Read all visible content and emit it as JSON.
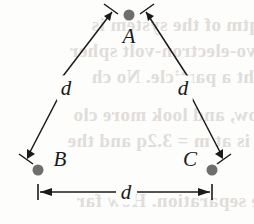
{
  "figure": {
    "name": "equilateral-triangle-distance-diagram",
    "type": "geometry-diagram",
    "width": 254,
    "height": 224,
    "background_color": "#fdfdfc",
    "ink_color": "#1a1a1a",
    "dot_color": "#6e6e6e"
  },
  "vertices": [
    {
      "id": "A",
      "label": "A",
      "x": 129,
      "y": 15,
      "label_x": 129,
      "label_y": 36
    },
    {
      "id": "B",
      "label": "B",
      "x": 38,
      "y": 170,
      "label_x": 60,
      "label_y": 159
    },
    {
      "id": "C",
      "label": "C",
      "x": 212,
      "y": 170,
      "label_x": 190,
      "label_y": 159
    }
  ],
  "side_labels": [
    {
      "id": "left-side",
      "label": "d",
      "x": 66,
      "y": 88
    },
    {
      "id": "right-side",
      "label": "d",
      "x": 183,
      "y": 88
    },
    {
      "id": "bottom-side",
      "label": "d",
      "x": 126,
      "y": 192
    }
  ],
  "dimension_line": {
    "label": "d",
    "x_start": 38,
    "x_end": 212,
    "y": 192,
    "tick_height": 16,
    "arrowheads": "both"
  },
  "arrows": [
    {
      "id": "arrow-B-to-A",
      "from": "B",
      "to": "A",
      "direction": "up-right",
      "tip_tick": true
    },
    {
      "id": "arrow-C-to-A",
      "from": "C",
      "to": "A",
      "direction": "up-left",
      "tip_tick": true
    },
    {
      "id": "arrow-A-past-B",
      "from": "A",
      "to": "beyond-B",
      "direction": "down-left",
      "tip_tick": true
    },
    {
      "id": "arrow-A-past-C",
      "from": "A",
      "to": "beyond-C",
      "direction": "down-right",
      "tip_tick": true
    }
  ],
  "ghost_text": {
    "description": "faint show-through text from the reverse side of the printed page",
    "color": "#cfcac6",
    "lines": [
      {
        "text": "qtm of the system is",
        "x": 6,
        "y": 14
      },
      {
        "text": "vo-electron-volt spher",
        "x": 2,
        "y": 40
      },
      {
        "text": "ght a particle. No ch",
        "x": 10,
        "y": 66
      },
      {
        "text": "ow, and look more clo",
        "x": 4,
        "y": 104
      },
      {
        "text": "t is at m = 3.2q and the",
        "x": 8,
        "y": 130
      },
      {
        "text": "e separation. How far",
        "x": 6,
        "y": 190
      }
    ]
  }
}
